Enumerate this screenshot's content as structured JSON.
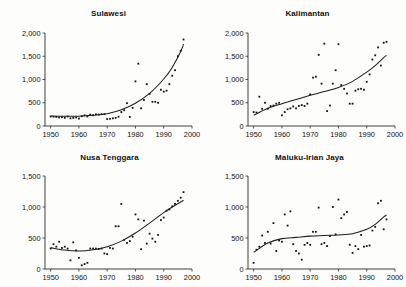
{
  "figure": {
    "background_color": "#fdfdfb",
    "ink_color": "#1d1d1d",
    "panel_count": 4
  },
  "chart_data": [
    {
      "type": "scatter",
      "title": "Sulawesi",
      "xlabel": "",
      "ylabel": "",
      "xlim": [
        1948,
        2000
      ],
      "ylim": [
        0,
        2000
      ],
      "xticks": [
        1950,
        1960,
        1970,
        1980,
        1990,
        2000
      ],
      "xtick_labels": [
        "1950",
        "1960",
        "1970",
        "1980",
        "1990",
        "2000"
      ],
      "yticks": [
        0,
        500,
        1000,
        1500,
        2000
      ],
      "ytick_labels": [
        "0",
        "500",
        "1,000",
        "1,500",
        "2,000"
      ],
      "grid": false,
      "legend": "none",
      "series": [
        {
          "name": "observations",
          "marker": "square-dot",
          "x": [
            1950,
            1951,
            1952,
            1953,
            1954,
            1955,
            1956,
            1957,
            1958,
            1959,
            1960,
            1961,
            1962,
            1963,
            1964,
            1965,
            1966,
            1967,
            1968,
            1969,
            1970,
            1971,
            1972,
            1973,
            1974,
            1975,
            1976,
            1977,
            1978,
            1979,
            1980,
            1981,
            1982,
            1983,
            1984,
            1985,
            1986,
            1987,
            1988,
            1989,
            1990,
            1991,
            1992,
            1993,
            1994,
            1995,
            1996,
            1997
          ],
          "y": [
            205,
            200,
            195,
            185,
            190,
            175,
            205,
            165,
            175,
            185,
            160,
            210,
            230,
            205,
            245,
            230,
            250,
            245,
            255,
            255,
            150,
            155,
            165,
            175,
            200,
            300,
            340,
            490,
            195,
            390,
            960,
            1340,
            380,
            560,
            900,
            690,
            520,
            520,
            500,
            780,
            740,
            760,
            900,
            1080,
            1200,
            1500,
            1620,
            1860
          ]
        },
        {
          "name": "fitted-trend",
          "type": "line",
          "x": [
            1950,
            1955,
            1960,
            1965,
            1970,
            1975,
            1980,
            1985,
            1990,
            1993,
            1996,
            1997
          ],
          "y": [
            215,
            210,
            210,
            230,
            265,
            350,
            490,
            700,
            1010,
            1260,
            1600,
            1760
          ]
        }
      ]
    },
    {
      "type": "scatter",
      "title": "Kalimantan",
      "xlabel": "",
      "ylabel": "",
      "xlim": [
        1948,
        2000
      ],
      "ylim": [
        0,
        2000
      ],
      "xticks": [
        1950,
        1960,
        1970,
        1980,
        1990,
        2000
      ],
      "xtick_labels": [
        "1950",
        "1960",
        "1970",
        "1980",
        "1990",
        "2000"
      ],
      "yticks": [
        0,
        500,
        1000,
        1500,
        2000
      ],
      "ytick_labels": [
        "0",
        "500",
        "1,000",
        "1,500",
        "2,000"
      ],
      "grid": false,
      "legend": "none",
      "series": [
        {
          "name": "observations",
          "marker": "square-dot",
          "x": [
            1950,
            1951,
            1952,
            1953,
            1954,
            1955,
            1956,
            1957,
            1958,
            1959,
            1960,
            1961,
            1962,
            1963,
            1964,
            1965,
            1966,
            1967,
            1968,
            1969,
            1970,
            1971,
            1972,
            1973,
            1974,
            1975,
            1976,
            1977,
            1978,
            1979,
            1980,
            1981,
            1982,
            1983,
            1984,
            1985,
            1986,
            1987,
            1988,
            1989,
            1990,
            1991,
            1992,
            1993,
            1994,
            1995,
            1996,
            1997
          ],
          "y": [
            300,
            290,
            630,
            370,
            500,
            370,
            430,
            440,
            480,
            500,
            230,
            300,
            360,
            380,
            420,
            380,
            430,
            450,
            430,
            480,
            680,
            1040,
            1060,
            1530,
            910,
            1770,
            320,
            440,
            910,
            1200,
            1760,
            880,
            800,
            700,
            480,
            480,
            760,
            790,
            800,
            780,
            950,
            1110,
            1430,
            1520,
            1690,
            1300,
            1790,
            1810
          ]
        },
        {
          "name": "fitted-trend",
          "type": "line",
          "x": [
            1950,
            1955,
            1960,
            1965,
            1970,
            1975,
            1980,
            1985,
            1990,
            1993,
            1996,
            1997
          ],
          "y": [
            230,
            380,
            480,
            570,
            660,
            740,
            830,
            960,
            1160,
            1300,
            1470,
            1520
          ]
        }
      ]
    },
    {
      "type": "scatter",
      "title": "Nusa Tenggara",
      "xlabel": "",
      "ylabel": "",
      "xlim": [
        1948,
        2000
      ],
      "ylim": [
        0,
        1500
      ],
      "xticks": [
        1950,
        1960,
        1970,
        1980,
        1990,
        2000
      ],
      "xtick_labels": [
        "1950",
        "1960",
        "1970",
        "1980",
        "1990",
        "2000"
      ],
      "yticks": [
        0,
        500,
        1000,
        1500
      ],
      "ytick_labels": [
        "0",
        "500",
        "1,000",
        "1,500"
      ],
      "grid": false,
      "legend": "none",
      "series": [
        {
          "name": "observations",
          "marker": "square-dot",
          "x": [
            1950,
            1951,
            1952,
            1953,
            1954,
            1955,
            1956,
            1957,
            1958,
            1959,
            1960,
            1961,
            1962,
            1963,
            1964,
            1965,
            1966,
            1967,
            1968,
            1969,
            1970,
            1971,
            1972,
            1973,
            1974,
            1975,
            1976,
            1977,
            1978,
            1979,
            1980,
            1981,
            1982,
            1983,
            1984,
            1985,
            1986,
            1987,
            1988,
            1989,
            1990,
            1991,
            1992,
            1993,
            1994,
            1995,
            1996,
            1997
          ],
          "y": [
            330,
            400,
            360,
            440,
            340,
            360,
            330,
            140,
            430,
            300,
            180,
            60,
            80,
            100,
            330,
            330,
            330,
            320,
            330,
            250,
            240,
            340,
            330,
            690,
            690,
            1050,
            470,
            420,
            450,
            520,
            880,
            800,
            320,
            780,
            410,
            570,
            490,
            440,
            550,
            790,
            830,
            940,
            960,
            1010,
            1050,
            1100,
            1150,
            1240
          ]
        },
        {
          "name": "fitted-trend",
          "type": "line",
          "x": [
            1950,
            1955,
            1960,
            1965,
            1970,
            1975,
            1980,
            1985,
            1990,
            1993,
            1996,
            1997
          ],
          "y": [
            345,
            305,
            290,
            310,
            360,
            450,
            580,
            740,
            910,
            1000,
            1080,
            1110
          ]
        }
      ]
    },
    {
      "type": "scatter",
      "title": "Maluku-Irian Jaya",
      "xlabel": "",
      "ylabel": "",
      "xlim": [
        1948,
        2000
      ],
      "ylim": [
        0,
        1500
      ],
      "xticks": [
        1950,
        1960,
        1970,
        1980,
        1990,
        2000
      ],
      "xtick_labels": [
        "1950",
        "1960",
        "1970",
        "1980",
        "1990",
        "2000"
      ],
      "yticks": [
        0,
        500,
        1000,
        1500
      ],
      "ytick_labels": [
        "0",
        "500",
        "1,000",
        "1,500"
      ],
      "grid": false,
      "legend": "none",
      "series": [
        {
          "name": "observations",
          "marker": "square-dot",
          "x": [
            1950,
            1951,
            1952,
            1953,
            1954,
            1955,
            1956,
            1957,
            1958,
            1959,
            1960,
            1961,
            1962,
            1963,
            1964,
            1965,
            1966,
            1967,
            1968,
            1969,
            1970,
            1971,
            1972,
            1973,
            1974,
            1975,
            1976,
            1977,
            1978,
            1979,
            1980,
            1981,
            1982,
            1983,
            1984,
            1985,
            1986,
            1987,
            1988,
            1989,
            1990,
            1991,
            1992,
            1993,
            1994,
            1995,
            1996,
            1997
          ],
          "y": [
            100,
            310,
            360,
            540,
            420,
            600,
            410,
            740,
            290,
            460,
            440,
            880,
            700,
            930,
            400,
            290,
            250,
            150,
            390,
            420,
            390,
            600,
            600,
            990,
            400,
            420,
            370,
            530,
            1000,
            560,
            1120,
            820,
            880,
            920,
            390,
            260,
            370,
            320,
            550,
            360,
            370,
            380,
            620,
            680,
            1060,
            1100,
            640,
            800
          ]
        },
        {
          "name": "fitted-trend",
          "type": "line",
          "x": [
            1950,
            1955,
            1960,
            1965,
            1970,
            1975,
            1980,
            1985,
            1990,
            1993,
            1996,
            1997
          ],
          "y": [
            270,
            420,
            490,
            510,
            530,
            540,
            550,
            570,
            640,
            720,
            840,
            870
          ]
        }
      ]
    }
  ]
}
